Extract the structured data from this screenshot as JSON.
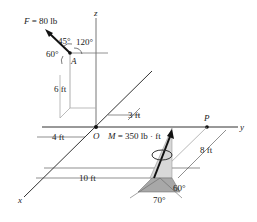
{
  "labels": {
    "force": "F = 80 lb",
    "angle45": "45°",
    "angle120": "120°",
    "angle60a": "60°",
    "pointA": "A",
    "height6": "6 ft",
    "axis_z": "z",
    "axis_y": "y",
    "axis_x": "x",
    "origin": "O",
    "dim3": "3 ft",
    "dim4": "4 ft",
    "moment": "M = 350 lb · ft",
    "pointP": "P",
    "dim8": "8 ft",
    "dim10": "10 ft",
    "angle60b": "60°",
    "angle70": "70°"
  },
  "colors": {
    "line": "#333333",
    "shade_dark": "#a8a8a8",
    "shade_light": "#d8d8d8",
    "arrow": "#111111"
  }
}
